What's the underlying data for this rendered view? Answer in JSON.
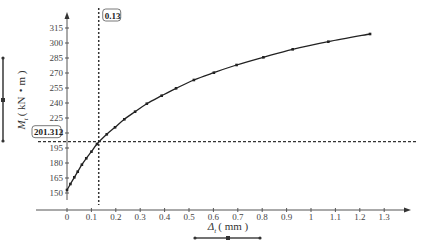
{
  "chart_data": {
    "type": "line",
    "title": "",
    "xlabel": "Δt (mm)",
    "ylabel": "Mt (kN・m)",
    "xlabel_main": "Δ",
    "xlabel_sub": "t",
    "xlabel_unit": "( mm )",
    "ylabel_main": "M",
    "ylabel_sub": "t",
    "ylabel_unit": "( kN・m )",
    "xlim": [
      0,
      1.35
    ],
    "ylim": [
      150,
      320
    ],
    "x_ticks": [
      "0",
      "0.1",
      "0.2",
      "0.3",
      "0.4",
      "0.5",
      "0.6",
      "0.7",
      "0.8",
      "0.9",
      "1",
      "1.1",
      "1.2",
      "1.3"
    ],
    "x_tick_values": [
      0,
      0.1,
      0.2,
      0.3,
      0.4,
      0.5,
      0.6,
      0.7,
      0.8,
      0.9,
      1.0,
      1.1,
      1.2,
      1.3
    ],
    "y_ticks": [
      "150",
      "165",
      "180",
      "195",
      "210",
      "225",
      "240",
      "255",
      "270",
      "285",
      "300",
      "315"
    ],
    "y_tick_values": [
      150,
      165,
      180,
      195,
      210,
      225,
      240,
      255,
      270,
      285,
      300,
      315
    ],
    "grid": false,
    "series": [
      {
        "name": "Mt-Δt curve",
        "x": [
          0,
          0.014,
          0.03,
          0.044,
          0.061,
          0.079,
          0.1,
          0.123,
          0.163,
          0.197,
          0.235,
          0.279,
          0.327,
          0.388,
          0.447,
          0.52,
          0.602,
          0.695,
          0.805,
          0.925,
          1.071,
          1.242
        ],
        "y": [
          153,
          159,
          165.7,
          171.3,
          178.3,
          184.7,
          191.3,
          199,
          208.7,
          215.7,
          223.7,
          231.3,
          239.3,
          247.3,
          254.7,
          263,
          270.3,
          278,
          285.7,
          293.7,
          301.3,
          309
        ]
      }
    ],
    "annotations": [
      {
        "type": "vline",
        "x": 0.13,
        "label": "0.13"
      },
      {
        "type": "hline",
        "y": 201.312,
        "label": "201.312"
      }
    ],
    "legend": "none"
  },
  "labels": {
    "vline_value": "0.13",
    "hline_value": "201.312"
  },
  "colors": {
    "curve": "#222222",
    "axis": "#555555",
    "dashed": "#333333",
    "bracket": "#444444"
  }
}
